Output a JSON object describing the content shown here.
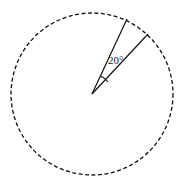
{
  "diagram": {
    "type": "circle-sector",
    "circle": {
      "cx": 92,
      "cy": 94,
      "r": 81,
      "stroke": "#111111",
      "dashed": true
    },
    "center": {
      "x": 92,
      "y": 94
    },
    "radii": [
      {
        "x2": 127,
        "y2": 19
      },
      {
        "x2": 148,
        "y2": 34
      }
    ],
    "angle": {
      "value": 20,
      "label": "20°"
    }
  }
}
